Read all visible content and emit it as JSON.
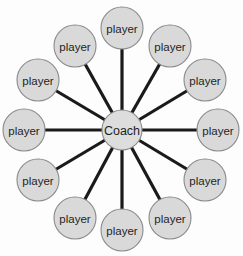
{
  "diagram": {
    "type": "star-network",
    "background_color": "#fdfdfd",
    "node_fill_color": "#d9d9d9",
    "node_stroke_color": "#8a8a8a",
    "edge_color": "#1a1a1a",
    "label_color": "#1f1f1f",
    "hub": {
      "id": "coach",
      "label": "Coach",
      "cx": 122,
      "cy": 130,
      "r": 20
    },
    "spoke_count": 12,
    "spokes": [
      {
        "id": "player-1",
        "label": "player",
        "cx": 122,
        "cy": 28,
        "r": 21,
        "angle_deg": 270
      },
      {
        "id": "player-2",
        "label": "player",
        "cx": 170,
        "cy": 46,
        "r": 21,
        "angle_deg": 300
      },
      {
        "id": "player-3",
        "label": "player",
        "cx": 205,
        "cy": 80,
        "r": 21,
        "angle_deg": 330
      },
      {
        "id": "player-4",
        "label": "player",
        "cx": 218,
        "cy": 130,
        "r": 21,
        "angle_deg": 0
      },
      {
        "id": "player-5",
        "label": "player",
        "cx": 205,
        "cy": 180,
        "r": 21,
        "angle_deg": 30
      },
      {
        "id": "player-6",
        "label": "player",
        "cx": 170,
        "cy": 218,
        "r": 21,
        "angle_deg": 60
      },
      {
        "id": "player-7",
        "label": "player",
        "cx": 122,
        "cy": 230,
        "r": 21,
        "angle_deg": 90
      },
      {
        "id": "player-8",
        "label": "player",
        "cx": 75,
        "cy": 218,
        "r": 21,
        "angle_deg": 120
      },
      {
        "id": "player-9",
        "label": "player",
        "cx": 38,
        "cy": 180,
        "r": 21,
        "angle_deg": 150
      },
      {
        "id": "player-10",
        "label": "player",
        "cx": 24,
        "cy": 130,
        "r": 21,
        "angle_deg": 180
      },
      {
        "id": "player-11",
        "label": "player",
        "cx": 38,
        "cy": 80,
        "r": 21,
        "angle_deg": 210
      },
      {
        "id": "player-12",
        "label": "player",
        "cx": 75,
        "cy": 46,
        "r": 21,
        "angle_deg": 240
      }
    ]
  }
}
